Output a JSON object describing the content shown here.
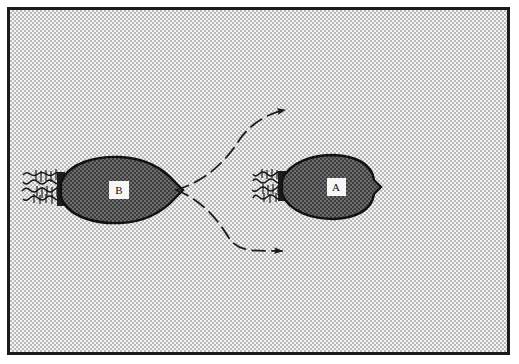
{
  "figure": {
    "caption_visible": false,
    "background_style": "halftone-dither-gray",
    "frame_color": "#1b1b1b",
    "canvas_color": "#f2f2f2"
  },
  "colors": {
    "body_fill": "#4a4a4a",
    "body_outline": "#111111",
    "flagella": "#151515",
    "arrow": "#1a1a1a",
    "label_box_fill": "#f7f7f7",
    "label_text": "#101010"
  },
  "organisms": [
    {
      "id": "organism-b",
      "label": "B",
      "label_x": 114,
      "label_y": 180,
      "body": {
        "cx": 113,
        "cy": 180,
        "left_x": 58,
        "right_tip_x": 173,
        "half_height": 25
      },
      "flagella_count": 3,
      "flagella_side": "left",
      "orientation": "pointing-right"
    },
    {
      "id": "organism-a",
      "label": "A",
      "label_x": 332,
      "label_y": 177,
      "body": {
        "cx": 331,
        "cy": 177,
        "left_x": 287,
        "right_tip_x": 378,
        "half_height": 23
      },
      "flagella_count": 3,
      "flagella_side": "left",
      "orientation": "pointing-right"
    }
  ],
  "arrows": [
    {
      "id": "arrow-upper-path",
      "style": "dashed-curve",
      "origin": {
        "x": 173,
        "y": 180
      },
      "control": {
        "x": 228,
        "y": 130
      },
      "tip": {
        "x": 287,
        "y": 105
      },
      "direction": "up-right"
    },
    {
      "id": "arrow-lower-path",
      "style": "dashed-curve",
      "origin": {
        "x": 173,
        "y": 180
      },
      "control": {
        "x": 222,
        "y": 222
      },
      "tip": {
        "x": 285,
        "y": 246
      },
      "direction": "down-right"
    }
  ]
}
